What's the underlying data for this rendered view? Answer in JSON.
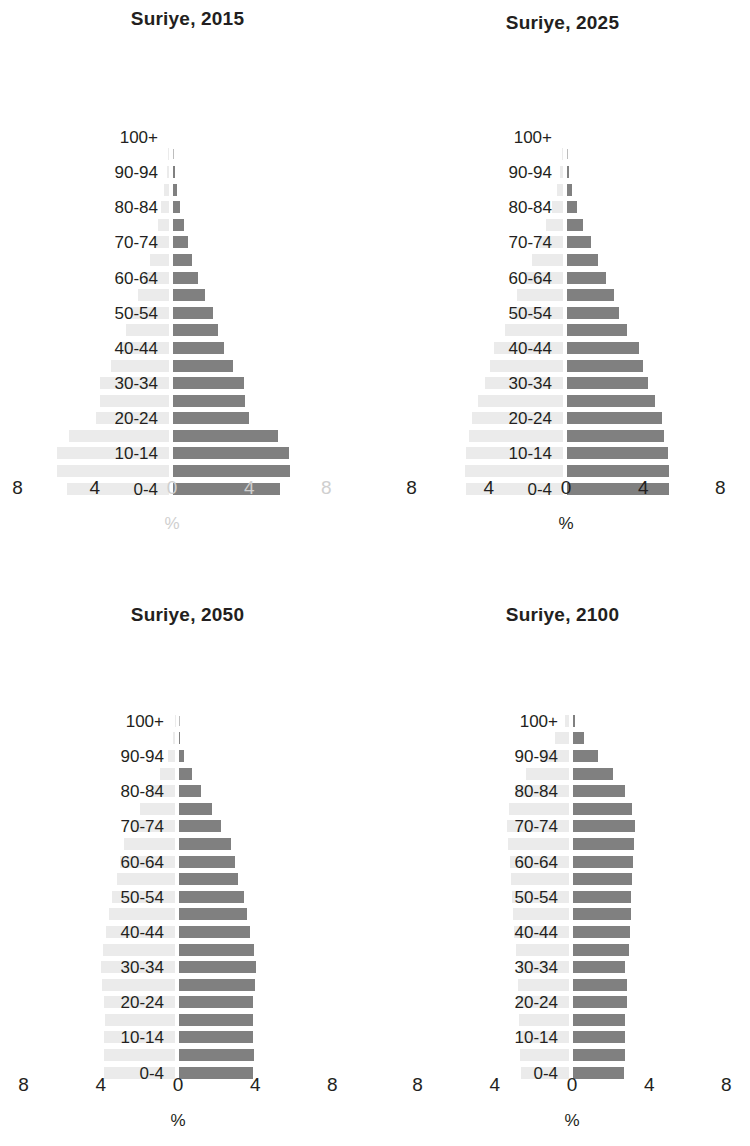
{
  "figure": {
    "region_name": "Suriye",
    "axis_unit_label": "%",
    "x_ticks": [
      "8",
      "4",
      "0",
      "4",
      "8"
    ],
    "age_group_labels": [
      "100+",
      "",
      "90-94",
      "",
      "80-84",
      "",
      "70-74",
      "",
      "60-64",
      "",
      "50-54",
      "",
      "40-44",
      "",
      "30-34",
      "",
      "20-24",
      "",
      "10-14",
      "",
      "0-4"
    ],
    "bar_color": "#808080",
    "ghost_bar_color": "#ebebeb",
    "faded_tick_color": "#cfcfcf",
    "text_color": "#231f20"
  },
  "panels": [
    {
      "id": "p2015",
      "title": "Suriye, 2015",
      "year": "2015",
      "right_ticks_faded": true
    },
    {
      "id": "p2025",
      "title": "Suriye, 2025",
      "year": "2025",
      "right_ticks_faded": false
    },
    {
      "id": "p2050",
      "title": "Suriye, 2050",
      "year": "2050",
      "right_ticks_faded": false
    },
    {
      "id": "p2100",
      "title": "Suriye, 2100",
      "year": "2100",
      "right_ticks_faded": false
    }
  ],
  "chart_data": [
    {
      "type": "bar",
      "subtype": "population-pyramid",
      "title": "Suriye, 2015",
      "xlabel": "%",
      "ylabel": "",
      "xlim": [
        -8,
        8
      ],
      "x_ticks": [
        8,
        4,
        0,
        4,
        8
      ],
      "grid": false,
      "legend": "none",
      "categories": [
        "0-4",
        "5-9",
        "10-14",
        "15-19",
        "20-24",
        "25-29",
        "30-34",
        "35-39",
        "40-44",
        "45-49",
        "50-54",
        "55-59",
        "60-64",
        "65-69",
        "70-74",
        "75-79",
        "80-84",
        "85-89",
        "90-94",
        "95-99",
        "100+"
      ],
      "series": [
        {
          "name": "male",
          "side": "right",
          "values": [
            5.55,
            6.05,
            6.02,
            5.45,
            3.95,
            3.75,
            3.7,
            3.1,
            2.62,
            2.32,
            2.05,
            1.65,
            1.32,
            1.0,
            0.78,
            0.55,
            0.38,
            0.2,
            0.08,
            0.02,
            0.0
          ]
        },
        {
          "name": "female",
          "side": "left",
          "values": [
            5.3,
            5.8,
            5.78,
            5.2,
            3.8,
            3.6,
            3.55,
            2.98,
            2.52,
            2.24,
            1.98,
            1.6,
            1.3,
            1.0,
            0.8,
            0.58,
            0.42,
            0.24,
            0.1,
            0.03,
            0.0
          ]
        }
      ]
    },
    {
      "type": "bar",
      "subtype": "population-pyramid",
      "title": "Suriye, 2025",
      "xlabel": "%",
      "ylabel": "",
      "xlim": [
        -8,
        8
      ],
      "x_ticks": [
        8,
        4,
        0,
        4,
        8
      ],
      "grid": false,
      "legend": "none",
      "categories": [
        "0-4",
        "5-9",
        "10-14",
        "15-19",
        "20-24",
        "25-29",
        "30-34",
        "35-39",
        "40-44",
        "45-49",
        "50-54",
        "55-59",
        "60-64",
        "65-69",
        "70-74",
        "75-79",
        "80-84",
        "85-89",
        "90-94",
        "95-99",
        "100+"
      ],
      "series": [
        {
          "name": "male",
          "side": "right",
          "values": [
            5.3,
            5.3,
            5.25,
            5.05,
            4.9,
            4.55,
            4.2,
            3.95,
            3.72,
            3.1,
            2.7,
            2.42,
            2.02,
            1.62,
            1.22,
            0.82,
            0.52,
            0.28,
            0.1,
            0.03,
            0.0
          ]
        },
        {
          "name": "female",
          "side": "left",
          "values": [
            5.05,
            5.08,
            5.02,
            4.85,
            4.7,
            4.38,
            4.05,
            3.8,
            3.58,
            3.0,
            2.62,
            2.36,
            1.98,
            1.6,
            1.24,
            0.88,
            0.58,
            0.33,
            0.13,
            0.04,
            0.0
          ]
        }
      ]
    },
    {
      "type": "bar",
      "subtype": "population-pyramid",
      "title": "Suriye, 2050",
      "xlabel": "%",
      "ylabel": "",
      "xlim": [
        -8,
        8
      ],
      "x_ticks": [
        8,
        4,
        0,
        4,
        8
      ],
      "grid": false,
      "legend": "none",
      "categories": [
        "0-4",
        "5-9",
        "10-14",
        "15-19",
        "20-24",
        "25-29",
        "30-34",
        "35-39",
        "40-44",
        "45-49",
        "50-54",
        "55-59",
        "60-64",
        "65-69",
        "70-74",
        "75-79",
        "80-84",
        "85-89",
        "90-94",
        "95-99",
        "100+"
      ],
      "series": [
        {
          "name": "male",
          "side": "right",
          "values": [
            3.85,
            3.88,
            3.85,
            3.82,
            3.85,
            3.95,
            3.98,
            3.88,
            3.7,
            3.52,
            3.38,
            3.05,
            2.92,
            2.68,
            2.2,
            1.72,
            1.15,
            0.68,
            0.28,
            0.07,
            0.01
          ]
        },
        {
          "name": "female",
          "side": "left",
          "values": [
            3.66,
            3.7,
            3.68,
            3.65,
            3.68,
            3.78,
            3.82,
            3.74,
            3.58,
            3.42,
            3.28,
            2.98,
            2.86,
            2.66,
            2.24,
            1.82,
            1.28,
            0.8,
            0.36,
            0.1,
            0.01
          ]
        }
      ]
    },
    {
      "type": "bar",
      "subtype": "population-pyramid",
      "title": "Suriye, 2100",
      "xlabel": "%",
      "ylabel": "",
      "xlim": [
        -8,
        8
      ],
      "x_ticks": [
        8,
        4,
        0,
        4,
        8
      ],
      "grid": false,
      "legend": "none",
      "categories": [
        "0-4",
        "5-9",
        "10-14",
        "15-19",
        "20-24",
        "25-29",
        "30-34",
        "35-39",
        "40-44",
        "45-49",
        "50-54",
        "55-59",
        "60-64",
        "65-69",
        "70-74",
        "75-79",
        "80-84",
        "85-89",
        "90-94",
        "95-99",
        "100+"
      ],
      "series": [
        {
          "name": "male",
          "side": "right",
          "values": [
            2.62,
            2.68,
            2.7,
            2.72,
            2.82,
            2.78,
            2.72,
            2.88,
            2.95,
            3.0,
            3.02,
            3.05,
            3.1,
            3.18,
            3.22,
            3.05,
            2.68,
            2.05,
            1.28,
            0.55,
            0.12
          ]
        },
        {
          "name": "female",
          "side": "left",
          "values": [
            2.48,
            2.54,
            2.56,
            2.58,
            2.68,
            2.66,
            2.6,
            2.76,
            2.84,
            2.9,
            2.94,
            2.98,
            3.05,
            3.15,
            3.22,
            3.1,
            2.8,
            2.25,
            1.5,
            0.72,
            0.2
          ]
        }
      ]
    }
  ]
}
